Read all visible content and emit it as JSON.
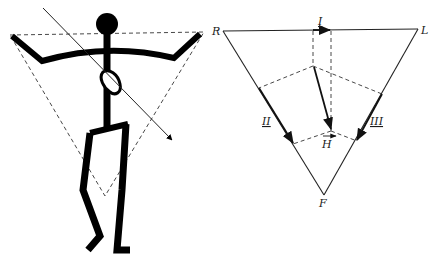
{
  "figure": {
    "title": "",
    "left_panel": {
      "description": "stick figure with Einthoven triangle overlay and heart axis arrow"
    },
    "right_panel": {
      "vertices": {
        "right_arm": "R",
        "left_arm": "L",
        "foot": "F"
      },
      "leads": {
        "lead_1": "I",
        "lead_2": "II",
        "lead_3": "III"
      },
      "heart_vector": "H"
    },
    "colors": {
      "ink": "#000000",
      "background": "#ffffff"
    }
  }
}
